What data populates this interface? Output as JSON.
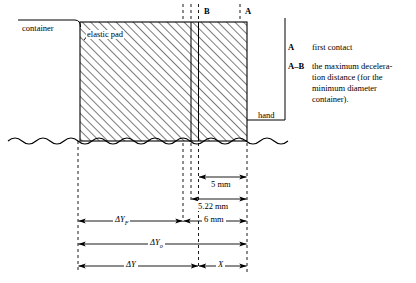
{
  "figure": {
    "labels": {
      "container": "container",
      "elastic_pad": "elastic pad",
      "hand": "hand",
      "point_a": "A",
      "point_b": "B"
    },
    "legend": [
      {
        "key": "A",
        "lines": [
          "first contact"
        ]
      },
      {
        "key": "A–B",
        "lines": [
          "the maximum decelera-",
          "tion distance (for the",
          "minimum diameter",
          "container)."
        ]
      }
    ],
    "dimensions": [
      {
        "name": "five-mm",
        "label": "5 mm"
      },
      {
        "name": "five-twenty-two-mm",
        "label": "5.22 mm"
      },
      {
        "name": "six-mm",
        "label": "6 mm"
      },
      {
        "name": "delta-y-f",
        "label": "ΔY",
        "sub": "F"
      },
      {
        "name": "delta-y-o",
        "label": "ΔY",
        "sub": "o"
      },
      {
        "name": "delta-y",
        "label": "ΔY",
        "sub": ""
      },
      {
        "name": "x-distance",
        "label": "X",
        "sub": ""
      }
    ],
    "colors": {
      "ink": "#000000",
      "background": "#ffffff",
      "hatch": "#1a1a1a"
    }
  }
}
